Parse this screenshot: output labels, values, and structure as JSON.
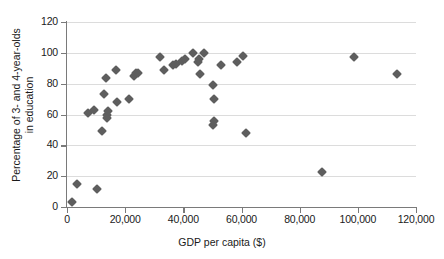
{
  "chart_data": {
    "type": "scatter",
    "title": "",
    "xlabel": "GDP per capita ($)",
    "ylabel": "Percentage of 3- and 4-year-olds in education",
    "ylabel_line1": "Percentage of 3- and 4-year-olds",
    "ylabel_line2": "in education",
    "xlim": [
      0,
      120000
    ],
    "ylim": [
      0,
      120
    ],
    "xticks": [
      0,
      20000,
      40000,
      60000,
      80000,
      100000,
      120000
    ],
    "xticklabels": [
      "0",
      "20,000",
      "40,000",
      "60,000",
      "80,000",
      "100,000",
      "120,000"
    ],
    "yticks": [
      0,
      20,
      40,
      60,
      80,
      100,
      120
    ],
    "yticklabels": [
      "0",
      "20",
      "40",
      "60",
      "80",
      "100",
      "120"
    ],
    "grid": "horizontal",
    "legend": "none",
    "marker": "diamond",
    "marker_color": "#5e5e5e",
    "grid_color": "#dcdcdc",
    "axis_color": "#7a7a7a",
    "points": [
      {
        "x": 1800,
        "y": 3
      },
      {
        "x": 3600,
        "y": 15
      },
      {
        "x": 10400,
        "y": 12
      },
      {
        "x": 7200,
        "y": 61
      },
      {
        "x": 9400,
        "y": 63
      },
      {
        "x": 12200,
        "y": 49
      },
      {
        "x": 12800,
        "y": 73
      },
      {
        "x": 13400,
        "y": 84
      },
      {
        "x": 13600,
        "y": 58
      },
      {
        "x": 13900,
        "y": 60
      },
      {
        "x": 14100,
        "y": 62
      },
      {
        "x": 16900,
        "y": 89
      },
      {
        "x": 17200,
        "y": 68
      },
      {
        "x": 21200,
        "y": 70
      },
      {
        "x": 22900,
        "y": 85
      },
      {
        "x": 23800,
        "y": 87
      },
      {
        "x": 24300,
        "y": 87
      },
      {
        "x": 31900,
        "y": 97
      },
      {
        "x": 33200,
        "y": 89
      },
      {
        "x": 36600,
        "y": 92
      },
      {
        "x": 37600,
        "y": 93
      },
      {
        "x": 39700,
        "y": 95
      },
      {
        "x": 40500,
        "y": 96
      },
      {
        "x": 43400,
        "y": 100
      },
      {
        "x": 44900,
        "y": 94
      },
      {
        "x": 45400,
        "y": 96
      },
      {
        "x": 45900,
        "y": 86
      },
      {
        "x": 47100,
        "y": 100
      },
      {
        "x": 50300,
        "y": 79
      },
      {
        "x": 50500,
        "y": 70
      },
      {
        "x": 50100,
        "y": 53
      },
      {
        "x": 50600,
        "y": 56
      },
      {
        "x": 52900,
        "y": 92
      },
      {
        "x": 58600,
        "y": 94
      },
      {
        "x": 60600,
        "y": 98
      },
      {
        "x": 61400,
        "y": 48
      },
      {
        "x": 87700,
        "y": 23
      },
      {
        "x": 98800,
        "y": 97
      },
      {
        "x": 113600,
        "y": 86
      }
    ]
  }
}
